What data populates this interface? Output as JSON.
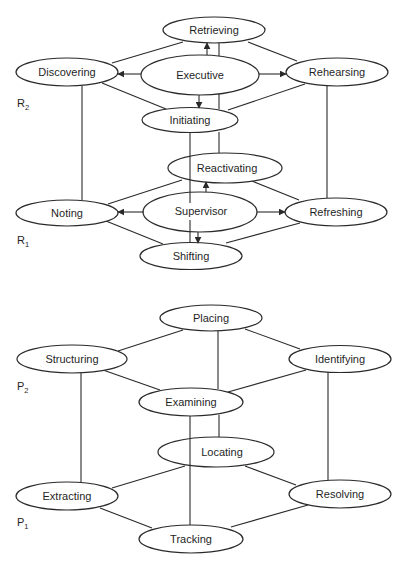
{
  "figure": {
    "colors": {
      "stroke": "#2a2a2a",
      "text": "#1f1f1f",
      "background": "#ffffff"
    },
    "top_diagram": {
      "levels": [
        {
          "letter": "R",
          "sub": "2"
        },
        {
          "letter": "R",
          "sub": "1"
        }
      ],
      "nodes": {
        "retrieving": {
          "label": "Retrieving",
          "level": "R2"
        },
        "discovering": {
          "label": "Discovering",
          "level": "R2"
        },
        "executive": {
          "label": "Executive",
          "level": "R2"
        },
        "rehearsing": {
          "label": "Rehearsing",
          "level": "R2"
        },
        "initiating": {
          "label": "Initiating",
          "level": "R2"
        },
        "reactivating": {
          "label": "Reactivating",
          "level": "R1"
        },
        "noting": {
          "label": "Noting",
          "level": "R1"
        },
        "supervisor": {
          "label": "Supervisor",
          "level": "R1"
        },
        "refreshing": {
          "label": "Refreshing",
          "level": "R1"
        },
        "shifting": {
          "label": "Shifting",
          "level": "R1"
        }
      },
      "edges": [
        {
          "from": "Executive",
          "to": "Retrieving",
          "type": "arrow"
        },
        {
          "from": "Executive",
          "to": "Discovering",
          "type": "arrow"
        },
        {
          "from": "Executive",
          "to": "Rehearsing",
          "type": "arrow"
        },
        {
          "from": "Executive",
          "to": "Initiating",
          "type": "arrow"
        },
        {
          "from": "Supervisor",
          "to": "Reactivating",
          "type": "arrow"
        },
        {
          "from": "Supervisor",
          "to": "Noting",
          "type": "arrow"
        },
        {
          "from": "Supervisor",
          "to": "Refreshing",
          "type": "arrow"
        },
        {
          "from": "Supervisor",
          "to": "Shifting",
          "type": "arrow"
        },
        {
          "from": "Retrieving",
          "to": "Discovering",
          "type": "line"
        },
        {
          "from": "Retrieving",
          "to": "Rehearsing",
          "type": "line"
        },
        {
          "from": "Discovering",
          "to": "Initiating",
          "type": "line"
        },
        {
          "from": "Rehearsing",
          "to": "Initiating",
          "type": "line"
        },
        {
          "from": "Retrieving",
          "to": "Initiating",
          "type": "line"
        },
        {
          "from": "Discovering",
          "to": "Noting",
          "type": "line"
        },
        {
          "from": "Rehearsing",
          "to": "Refreshing",
          "type": "line"
        },
        {
          "from": "Initiating",
          "to": "Reactivating",
          "type": "line"
        },
        {
          "from": "Initiating",
          "to": "Shifting",
          "type": "line"
        },
        {
          "from": "Noting",
          "to": "Reactivating",
          "type": "line"
        },
        {
          "from": "Reactivating",
          "to": "Refreshing",
          "type": "line"
        },
        {
          "from": "Noting",
          "to": "Shifting",
          "type": "line"
        },
        {
          "from": "Refreshing",
          "to": "Shifting",
          "type": "line"
        }
      ]
    },
    "bottom_diagram": {
      "levels": [
        {
          "letter": "P",
          "sub": "2"
        },
        {
          "letter": "P",
          "sub": "1"
        }
      ],
      "nodes": {
        "placing": {
          "label": "Placing",
          "level": "P2"
        },
        "structuring": {
          "label": "Structuring",
          "level": "P2"
        },
        "identifying": {
          "label": "Identifying",
          "level": "P2"
        },
        "examining": {
          "label": "Examining",
          "level": "P2"
        },
        "locating": {
          "label": "Locating",
          "level": "P1"
        },
        "extracting": {
          "label": "Extracting",
          "level": "P1"
        },
        "resolving": {
          "label": "Resolving",
          "level": "P1"
        },
        "tracking": {
          "label": "Tracking",
          "level": "P1"
        }
      },
      "edges": [
        {
          "from": "Placing",
          "to": "Structuring",
          "type": "line"
        },
        {
          "from": "Placing",
          "to": "Identifying",
          "type": "line"
        },
        {
          "from": "Structuring",
          "to": "Examining",
          "type": "line"
        },
        {
          "from": "Identifying",
          "to": "Examining",
          "type": "line"
        },
        {
          "from": "Placing",
          "to": "Examining",
          "type": "line"
        },
        {
          "from": "Structuring",
          "to": "Extracting",
          "type": "line"
        },
        {
          "from": "Identifying",
          "to": "Resolving",
          "type": "line"
        },
        {
          "from": "Examining",
          "to": "Locating",
          "type": "line"
        },
        {
          "from": "Examining",
          "to": "Tracking",
          "type": "line"
        },
        {
          "from": "Locating",
          "to": "Extracting",
          "type": "line"
        },
        {
          "from": "Locating",
          "to": "Resolving",
          "type": "line"
        },
        {
          "from": "Extracting",
          "to": "Tracking",
          "type": "line"
        },
        {
          "from": "Resolving",
          "to": "Tracking",
          "type": "line"
        }
      ]
    }
  }
}
